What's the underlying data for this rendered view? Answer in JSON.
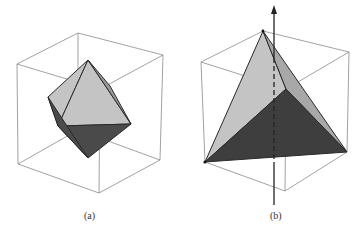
{
  "figure": {
    "panels": [
      {
        "id": "a",
        "caption": "(a)",
        "solid": "octahedron inscribed in cube"
      },
      {
        "id": "b",
        "caption": "(b)",
        "solid": "tetrahedron inscribed in cube with rotation axis"
      }
    ],
    "figure_label_partial": "Figure 7.5",
    "colors": {
      "cube_edge": "#8a8a8a",
      "light_face": "#c4c4c4",
      "mid_face": "#a8a8a8",
      "dark_face": "#4a4a4a",
      "edge": "#2a2a2a",
      "background": "#ffffff"
    }
  }
}
